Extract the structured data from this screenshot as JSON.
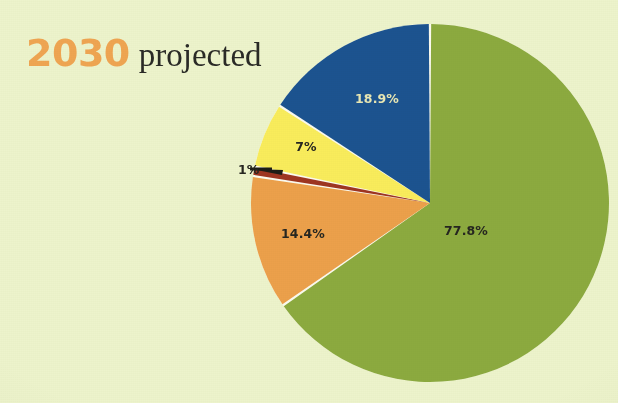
{
  "page": {
    "background_color": "#edf3cc"
  },
  "title": {
    "year": "2030",
    "year_color": "#efa552",
    "qualifier": "projected",
    "qualifier_color": "#2a2a26"
  },
  "chart_data": {
    "type": "pie",
    "xlabel": "",
    "ylabel": "",
    "legend": "none",
    "grid": false,
    "start_angle_deg": 0,
    "direction": "clockwise",
    "separator_color": "#fbfaf0",
    "categories": [
      "77.8%",
      "14.4%",
      "1%",
      "7%",
      "18.9%"
    ],
    "values": [
      77.8,
      14.4,
      1.0,
      7.0,
      18.9
    ],
    "slices": [
      {
        "label": "77.8%",
        "value": 77.8,
        "color": "#8caa3f",
        "label_color": "#262620",
        "label_placement": "inside"
      },
      {
        "label": "14.4%",
        "value": 14.4,
        "color": "#eca04b",
        "label_color": "#262620",
        "label_placement": "inside"
      },
      {
        "label": "1%",
        "value": 1.0,
        "color": "#9e3521",
        "label_color": "#262620",
        "label_placement": "outside"
      },
      {
        "label": "7%",
        "value": 7.0,
        "color": "#f9ec5c",
        "label_color": "#262620",
        "label_placement": "inside"
      },
      {
        "label": "18.9%",
        "value": 18.9,
        "color": "#1c5390",
        "label_color": "#e9e7b4",
        "label_placement": "inside"
      }
    ]
  }
}
